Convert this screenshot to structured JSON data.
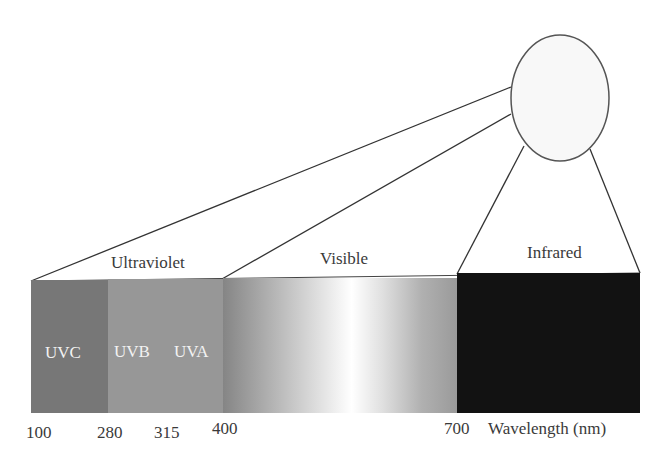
{
  "source": {
    "shape": "circle",
    "fill": "#f8f8f8",
    "stroke": "#555555"
  },
  "regions": [
    {
      "label": "Ultraviolet",
      "from_nm": 100,
      "to_nm": 400
    },
    {
      "label": "Visible",
      "from_nm": 400,
      "to_nm": 700
    },
    {
      "label": "Infrared",
      "from_nm": 700,
      "to_nm": null
    }
  ],
  "subbands": [
    {
      "label": "UVC",
      "from_nm": 100,
      "to_nm": 280,
      "color": "#777777"
    },
    {
      "label": "UVB",
      "from_nm": 280,
      "to_nm": 315,
      "color": "#979797"
    },
    {
      "label": "UVA",
      "from_nm": 315,
      "to_nm": 400,
      "color": "#979797"
    }
  ],
  "colors": {
    "visible_gradient": [
      "#858585",
      "#bdbdbd",
      "#ffffff",
      "#bdbdbd",
      "#9a9a9a"
    ],
    "infrared": "#121212"
  },
  "axis": {
    "ticks": [
      "100",
      "280",
      "315",
      "400",
      "700"
    ],
    "label": "Wavelength (nm)"
  }
}
